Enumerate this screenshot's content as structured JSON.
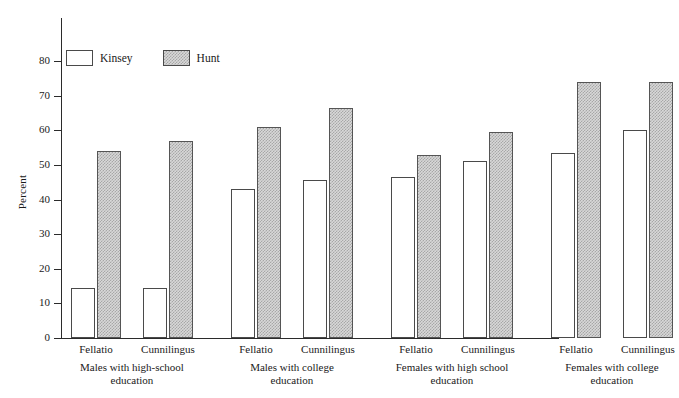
{
  "chart_data": {
    "type": "bar",
    "title": "",
    "xlabel": "",
    "ylabel": "Percent",
    "ylim": [
      0,
      80
    ],
    "ytick_step": 10,
    "yticks": [
      "80",
      "70",
      "60",
      "50",
      "40",
      "30",
      "20",
      "10",
      "0"
    ],
    "grid": false,
    "legend_position": "top-left",
    "categories": [
      "Fellatio",
      "Cunnilingus",
      "Fellatio",
      "Cunnilingus",
      "Fellatio",
      "Cunnilingus",
      "Fellatio",
      "Cunnilingus"
    ],
    "groups": [
      {
        "label_line1": "Males with high-school",
        "label_line2": "education",
        "categories": [
          "Fellatio",
          "Cunnilingus"
        ]
      },
      {
        "label_line1": "Males with college",
        "label_line2": "education",
        "categories": [
          "Fellatio",
          "Cunnilingus"
        ]
      },
      {
        "label_line1": "Females with high school",
        "label_line2": "education",
        "categories": [
          "Fellatio",
          "Cunnilingus"
        ]
      },
      {
        "label_line1": "Females with college",
        "label_line2": "education",
        "categories": [
          "Fellatio",
          "Cunnilingus"
        ]
      }
    ],
    "series": [
      {
        "name": "Kinsey",
        "values": [
          14.5,
          14.5,
          43,
          45.5,
          46.5,
          51,
          53.5,
          60
        ]
      },
      {
        "name": "Hunt",
        "values": [
          54,
          57,
          61,
          66.5,
          53,
          59.5,
          74,
          74
        ]
      }
    ],
    "legend": [
      {
        "name": "Kinsey",
        "fill": "#ffffff"
      },
      {
        "name": "Hunt",
        "fill": "#d8d8d8"
      }
    ]
  },
  "axis": {
    "y_title": "Percent"
  }
}
